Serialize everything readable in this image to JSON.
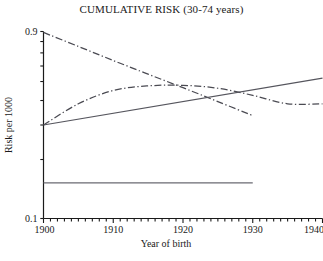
{
  "chart_data": {
    "type": "line",
    "title": "CUMULATIVE RISK (30-74 years)",
    "xlabel": "Year of birth",
    "ylabel": "Risk per 1000",
    "xlim": [
      1900,
      1940
    ],
    "ylim": [
      0.1,
      0.9
    ],
    "yscale": "log",
    "grid": false,
    "legend": "none",
    "xticks": [
      1900,
      1910,
      1920,
      1930,
      1940
    ],
    "xtick_labels": [
      "1900",
      "1910",
      "1920",
      "1930",
      "1940"
    ],
    "xminor_tick_step": 1,
    "yticks": [
      0.1,
      0.2,
      0.3,
      0.4,
      0.5,
      0.6,
      0.7,
      0.8,
      0.9
    ],
    "ytick_labels_shown": [
      "0.9",
      "0.1"
    ],
    "ytick_label_top": "0.9",
    "ytick_label_bottom": "0.1",
    "series": [
      {
        "name": "declining-cohort",
        "style": "dash-dot",
        "color": "#4a4a52",
        "x": [
          1900,
          1905,
          1910,
          1915,
          1920,
          1925,
          1930
        ],
        "values": [
          0.89,
          0.755,
          0.64,
          0.545,
          0.465,
          0.395,
          0.335
        ]
      },
      {
        "name": "peaking-cohort",
        "style": "dash-dot",
        "color": "#4a4a52",
        "x": [
          1900,
          1905,
          1910,
          1915,
          1920,
          1925,
          1930,
          1935,
          1940
        ],
        "values": [
          0.3,
          0.385,
          0.45,
          0.475,
          0.478,
          0.462,
          0.425,
          0.385,
          0.385
        ]
      },
      {
        "name": "rising-cohort",
        "style": "solid",
        "color": "#55555d",
        "x": [
          1900,
          1940
        ],
        "values": [
          0.3,
          0.52
        ]
      },
      {
        "name": "flat-cohort",
        "style": "solid",
        "color": "#6a6a72",
        "x": [
          1900,
          1930
        ],
        "values": [
          0.152,
          0.152
        ]
      }
    ]
  }
}
